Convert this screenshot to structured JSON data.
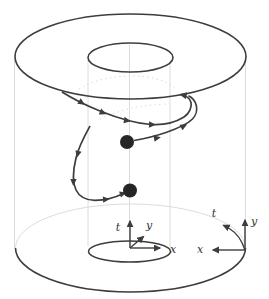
{
  "figure": {
    "background": "#ffffff",
    "colors": {
      "stroke_dark": "#3d3d3d",
      "stroke_faint": "#dcdcdc",
      "dot_fill": "#262626",
      "label_color": "#333333"
    },
    "center_frame": {
      "t_label": "t",
      "y_label": "y",
      "x_label": "x"
    },
    "right_frame": {
      "t_label": "t",
      "y_label": "y",
      "x_label": "x"
    }
  }
}
